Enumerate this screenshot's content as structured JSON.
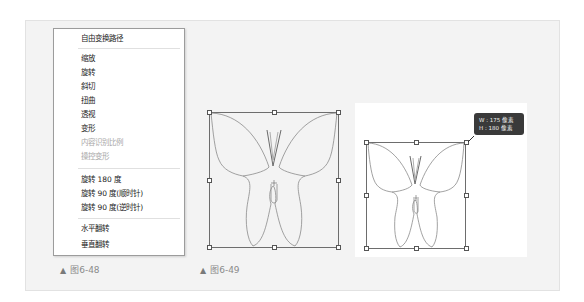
{
  "menu": {
    "items": [
      {
        "label": "自由变换路径",
        "enabled": true
      },
      {
        "label": "缩放",
        "enabled": true
      },
      {
        "label": "旋转",
        "enabled": true
      },
      {
        "label": "斜切",
        "enabled": true
      },
      {
        "label": "扭曲",
        "enabled": true
      },
      {
        "label": "透视",
        "enabled": true
      },
      {
        "label": "变形",
        "enabled": true
      },
      {
        "label": "内容识别比例",
        "enabled": false
      },
      {
        "label": "操控变形",
        "enabled": false
      },
      {
        "label": "旋转 180 度",
        "enabled": true
      },
      {
        "label": "旋转 90 度(顺时针)",
        "enabled": true
      },
      {
        "label": "旋转 90 度(逆时针)",
        "enabled": true
      },
      {
        "label": "水平翻转",
        "enabled": true
      },
      {
        "label": "垂直翻转",
        "enabled": true
      }
    ]
  },
  "captions": {
    "fig48": {
      "marker": "▲",
      "label": "图6-48"
    },
    "fig49": {
      "marker": "▲",
      "label": "图6-49"
    }
  },
  "tooltip": {
    "width_line": "W : 175 像素",
    "height_line": "H : 180 像素"
  },
  "colors": {
    "panel_bg": "#f3f3f3",
    "frame": "#6d6d6d",
    "tooltip_bg": "#3a3a3a"
  }
}
